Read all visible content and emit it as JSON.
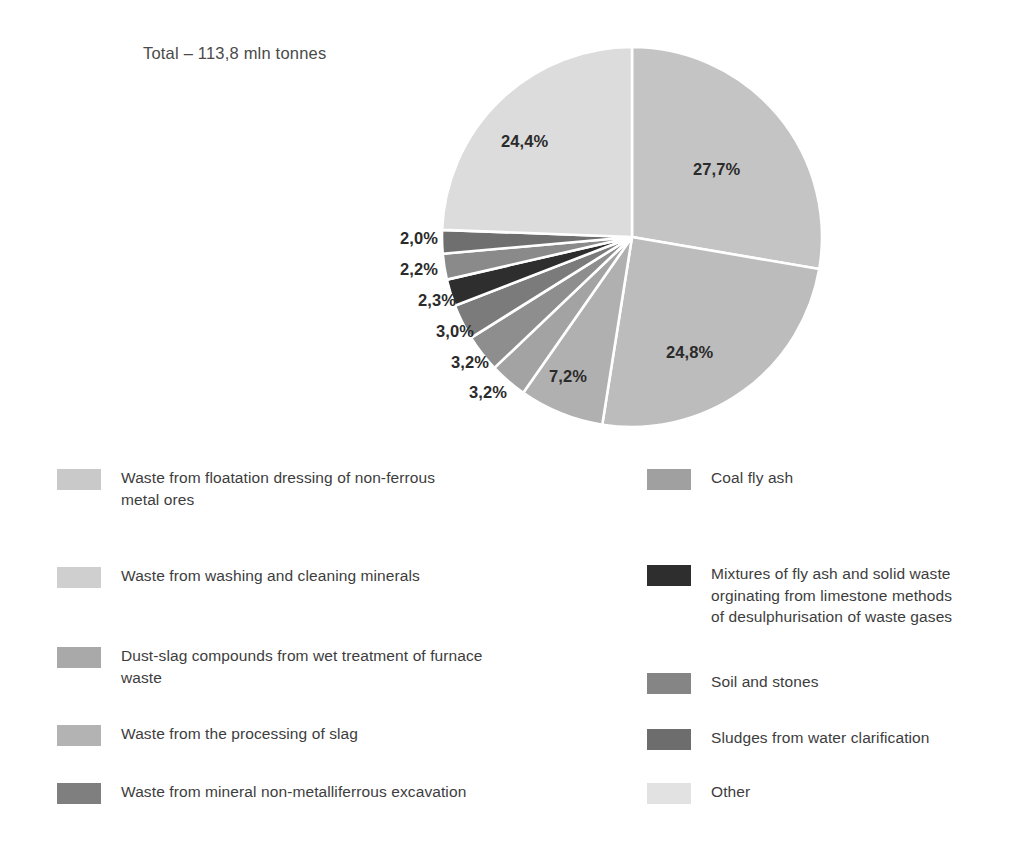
{
  "chart_data": {
    "type": "pie",
    "title": "Total – 113,8 mln tonnes",
    "total_value": 113.8,
    "unit": "mln tonnes",
    "start_angle_deg": 0,
    "direction": "clockwise",
    "legend_position": "bottom",
    "grid": false,
    "categories": [
      "Waste from floatation dressing of non-ferrous metal ores",
      "Coal fly ash",
      "Waste from washing and cleaning minerals",
      "Dust-slag compounds from wet treatment of furnace waste",
      "Waste from the processing of slag",
      "Waste from mineral non-metalliferrous excavation",
      "Mixtures of fly ash and solid waste orginating from limestone methods of desulphurisation of waste gases",
      "Soil and stones",
      "Sludges from water clarification",
      "Other"
    ],
    "values": [
      27.7,
      24.8,
      7.2,
      3.2,
      3.2,
      3.0,
      2.3,
      2.2,
      2.0,
      24.4
    ],
    "value_labels": [
      "27,7%",
      "24,8%",
      "7,2%",
      "3,2%",
      "3,2%",
      "3,0%",
      "2,3%",
      "2,2%",
      "2,0%",
      "24,4%"
    ],
    "colors": [
      "#c4c4c4",
      "#bcbcbc",
      "#b0b0b0",
      "#a3a3a3",
      "#8e8e8e",
      "#7b7b7b",
      "#2e2e2e",
      "#8a8a8a",
      "#6f6f6f",
      "#dcdcdc"
    ],
    "slice_label_positions": [
      {
        "label": "27,7%",
        "x": 693,
        "y": 160
      },
      {
        "label": "24,8%",
        "x": 666,
        "y": 343
      },
      {
        "label": "7,2%",
        "x": 549,
        "y": 367
      },
      {
        "label": "3,2%",
        "x": 469,
        "y": 383
      },
      {
        "label": "3,2%",
        "x": 451,
        "y": 353
      },
      {
        "label": "3,0%",
        "x": 436,
        "y": 322
      },
      {
        "label": "2,3%",
        "x": 418,
        "y": 291
      },
      {
        "label": "2,2%",
        "x": 400,
        "y": 260
      },
      {
        "label": "2,0%",
        "x": 400,
        "y": 229
      },
      {
        "label": "24,4%",
        "x": 501,
        "y": 132
      }
    ]
  },
  "legend": {
    "left_column": [
      {
        "label": "Waste from floatation dressing of non-ferrous\n metal ores",
        "color": "#c9c9c9",
        "top": 12
      },
      {
        "label": "Waste from washing and cleaning minerals",
        "color": "#cfcfcf",
        "top": 110
      },
      {
        "label": "Dust-slag compounds from wet treatment of furnace\n waste",
        "color": "#a9a9a9",
        "top": 190
      },
      {
        "label": "Waste from the processing of slag",
        "color": "#b3b3b3",
        "top": 268
      },
      {
        "label": "Waste from mineral non-metalliferrous excavation",
        "color": "#7f7f7f",
        "top": 326
      }
    ],
    "right_column": [
      {
        "label": "Coal fly ash",
        "color": "#a0a0a0",
        "top": 12
      },
      {
        "label": "Mixtures of fly ash and solid waste\n orginating from limestone methods\n of desulphurisation of waste gases",
        "color": "#2e2e2e",
        "top": 108
      },
      {
        "label": "Soil and stones",
        "color": "#858585",
        "top": 216
      },
      {
        "label": "Sludges from water clarification",
        "color": "#6d6d6d",
        "top": 272
      },
      {
        "label": "Other",
        "color": "#e2e2e2",
        "top": 326
      }
    ]
  }
}
